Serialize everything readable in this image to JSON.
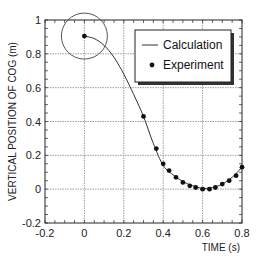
{
  "chart_data": {
    "type": "scatter",
    "title": "",
    "xlabel": "TIME (s)",
    "ylabel": "VERTICAL POSITION OF COG (m)",
    "xlim": [
      -0.2,
      0.8
    ],
    "ylim": [
      -0.2,
      1.0
    ],
    "xticks": [
      -0.2,
      0,
      0.2,
      0.4,
      0.6,
      0.8
    ],
    "yticks": [
      -0.2,
      0,
      0.2,
      0.4,
      0.6,
      0.8,
      1
    ],
    "xtick_labels": [
      "-0.2",
      "0",
      "0.2",
      "0.4",
      "0.6",
      "0.8"
    ],
    "ytick_labels": [
      "-0.2",
      "0",
      "0.2",
      "0.4",
      "0.6",
      "0.8",
      "1"
    ],
    "grid": true,
    "legend_position": "upper right",
    "series": [
      {
        "name": "Calculation",
        "style": "line",
        "x": [
          0,
          0.05,
          0.1,
          0.15,
          0.2,
          0.25,
          0.3,
          0.35,
          0.4,
          0.45,
          0.5,
          0.55,
          0.6,
          0.65,
          0.7,
          0.75,
          0.8
        ],
        "y": [
          0.905,
          0.89,
          0.85,
          0.78,
          0.68,
          0.56,
          0.43,
          0.27,
          0.14,
          0.085,
          0.045,
          0.02,
          0.005,
          0.01,
          0.03,
          0.07,
          0.13
        ]
      },
      {
        "name": "Experiment",
        "style": "marker",
        "x": [
          0,
          0.3,
          0.365,
          0.4,
          0.43,
          0.465,
          0.5,
          0.535,
          0.565,
          0.6,
          0.635,
          0.665,
          0.7,
          0.735,
          0.77,
          0.8
        ],
        "y": [
          0.905,
          0.43,
          0.24,
          0.15,
          0.11,
          0.07,
          0.04,
          0.02,
          0.01,
          0.0,
          0.0,
          0.01,
          0.03,
          0.05,
          0.08,
          0.13
        ]
      }
    ],
    "annotations": [
      {
        "type": "circle",
        "center": [
          0,
          0.905
        ],
        "label": ""
      }
    ]
  },
  "legend": {
    "items": [
      {
        "label": "Calculation",
        "symbol": "line"
      },
      {
        "label": "Experiment",
        "symbol": "dot"
      }
    ]
  },
  "axes": {
    "xlabel": "TIME (s)",
    "ylabel": "VERTICAL POSITION OF COG (m)"
  },
  "colors": {
    "line": "#333333",
    "marker": "#111111",
    "grid": "#888888",
    "axis": "#222222"
  }
}
